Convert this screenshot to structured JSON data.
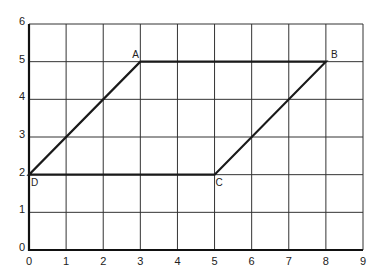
{
  "diagram": {
    "type": "coordinate-grid-parallelogram",
    "x_axis": {
      "min": 0,
      "max": 9,
      "ticks": [
        "0",
        "1",
        "2",
        "3",
        "4",
        "5",
        "6",
        "7",
        "8",
        "9"
      ]
    },
    "y_axis": {
      "min": 0,
      "max": 6,
      "ticks": [
        "0",
        "1",
        "2",
        "3",
        "4",
        "5",
        "6"
      ]
    },
    "vertices": [
      {
        "label": "A",
        "x": 3,
        "y": 5
      },
      {
        "label": "B",
        "x": 8,
        "y": 5
      },
      {
        "label": "C",
        "x": 5,
        "y": 2
      },
      {
        "label": "D",
        "x": 0,
        "y": 2
      }
    ],
    "shape_order": [
      "A",
      "B",
      "C",
      "D"
    ],
    "colors": {
      "grid": "#333333",
      "shape": "#1a1a1a",
      "text": "#222222"
    }
  }
}
